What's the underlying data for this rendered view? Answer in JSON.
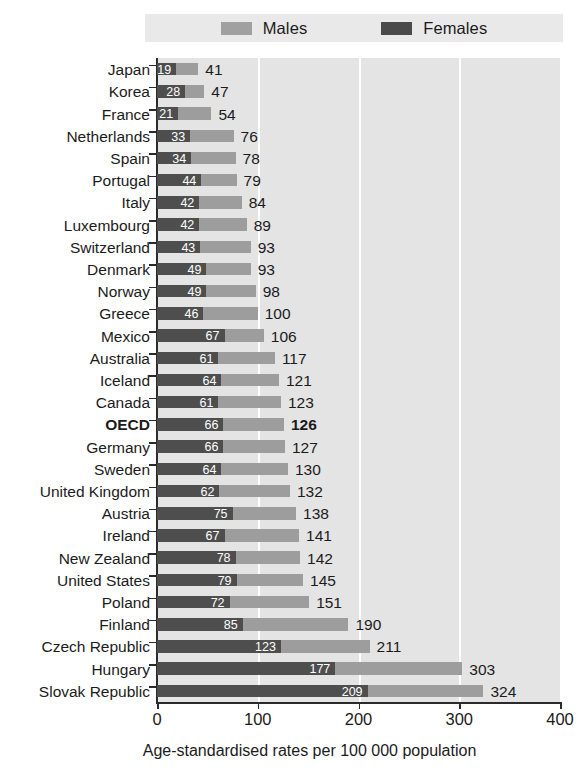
{
  "chart_data": {
    "type": "bar",
    "orientation": "horizontal",
    "title": "",
    "xlabel": "Age-standardised rates per 100 000 population",
    "ylabel": "",
    "xlim": [
      0,
      400
    ],
    "xticks": [
      0,
      100,
      200,
      300,
      400
    ],
    "grid": "vertical",
    "legend_position": "top",
    "legend": [
      "Males",
      "Females"
    ],
    "highlight_category": "OECD",
    "categories": [
      "Japan",
      "Korea",
      "France",
      "Netherlands",
      "Spain",
      "Portugal",
      "Italy",
      "Luxembourg",
      "Switzerland",
      "Denmark",
      "Norway",
      "Greece",
      "Mexico",
      "Australia",
      "Iceland",
      "Canada",
      "OECD",
      "Germany",
      "Sweden",
      "United Kingdom",
      "Austria",
      "Ireland",
      "New Zealand",
      "United States",
      "Poland",
      "Finland",
      "Czech Republic",
      "Hungary",
      "Slovak Republic"
    ],
    "series": [
      {
        "name": "Males",
        "color": "#9d9d9d",
        "values": [
          41,
          47,
          54,
          76,
          78,
          79,
          84,
          89,
          93,
          93,
          98,
          100,
          106,
          117,
          121,
          123,
          126,
          127,
          130,
          132,
          138,
          141,
          142,
          145,
          151,
          190,
          211,
          303,
          324
        ]
      },
      {
        "name": "Females",
        "color": "#4e4e4e",
        "values": [
          19,
          28,
          21,
          33,
          34,
          44,
          42,
          42,
          43,
          49,
          49,
          46,
          67,
          61,
          64,
          61,
          66,
          66,
          64,
          62,
          75,
          67,
          78,
          79,
          72,
          85,
          123,
          177,
          209
        ]
      }
    ]
  },
  "legend": {
    "males_label": "Males",
    "females_label": "Females"
  },
  "axis": {
    "title": "Age-standardised rates per 100 000 population",
    "tick_labels": [
      "0",
      "100",
      "200",
      "300",
      "400"
    ]
  },
  "colors": {
    "males": "#9d9d9d",
    "females": "#4e4e4e",
    "plot_background": "#e4e4e4",
    "legend_background": "#e9e9e9",
    "gridline": "#ffffff",
    "axis": "#2b2b2b"
  }
}
